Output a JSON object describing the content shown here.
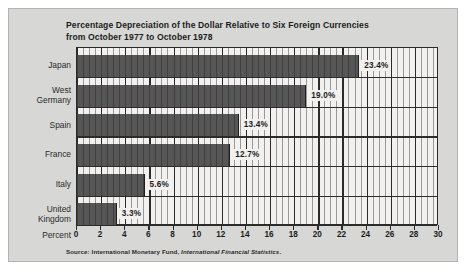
{
  "figure": {
    "title_line1": "Percentage Depreciation of the Dollar Relative to Six Foreign Currencies",
    "title_line2": "from October 1977 to October 1978",
    "axis_label": "Percent",
    "source_prefix": "Source: International Monetary Fund, ",
    "source_italic": "International Financial Statistics",
    "source_suffix": "."
  },
  "colors": {
    "panel_background": "#d7d7d5",
    "plot_background": "#f2f1ef",
    "bar_fill": "#565656",
    "gridline": "#2b2b2b",
    "text": "#1c1c1c"
  },
  "chart_data": {
    "type": "bar",
    "orientation": "horizontal",
    "title": "Percentage Depreciation of the Dollar Relative to Six Foreign Currencies from October 1977 to October 1978",
    "xlabel": "Percent",
    "ylabel": "",
    "xlim": [
      0,
      30
    ],
    "xticks": [
      0,
      2,
      4,
      6,
      8,
      10,
      12,
      14,
      16,
      18,
      20,
      22,
      24,
      26,
      28,
      30
    ],
    "xtick_labels": [
      "0",
      "2",
      "4",
      "6",
      "8",
      "10",
      "12",
      "14",
      "16",
      "18",
      "20",
      "22",
      "24",
      "26",
      "28",
      "30"
    ],
    "minor_tick_interval": 0.5,
    "grid": true,
    "legend": false,
    "categories": [
      "Japan",
      "West Germany",
      "Spain",
      "France",
      "Italy",
      "United Kingdom"
    ],
    "values": [
      23.4,
      19.0,
      13.4,
      12.7,
      5.6,
      3.3
    ],
    "data_labels": [
      "23.4%",
      "19.0%",
      "13.4%",
      "12.7%",
      "5.6%",
      "3.3%"
    ],
    "bars": [
      {
        "category": "Japan",
        "label_lines": [
          "Japan"
        ],
        "value": 23.4,
        "label": "23.4%"
      },
      {
        "category": "West Germany",
        "label_lines": [
          "West",
          "Germany"
        ],
        "value": 19.0,
        "label": "19.0%"
      },
      {
        "category": "Spain",
        "label_lines": [
          "Spain"
        ],
        "value": 13.4,
        "label": "13.4%"
      },
      {
        "category": "France",
        "label_lines": [
          "France"
        ],
        "value": 12.7,
        "label": "12.7%"
      },
      {
        "category": "Italy",
        "label_lines": [
          "Italy"
        ],
        "value": 5.6,
        "label": "5.6%"
      },
      {
        "category": "United Kingdom",
        "label_lines": [
          "United",
          "Kingdom"
        ],
        "value": 3.3,
        "label": "3.3%"
      }
    ]
  }
}
